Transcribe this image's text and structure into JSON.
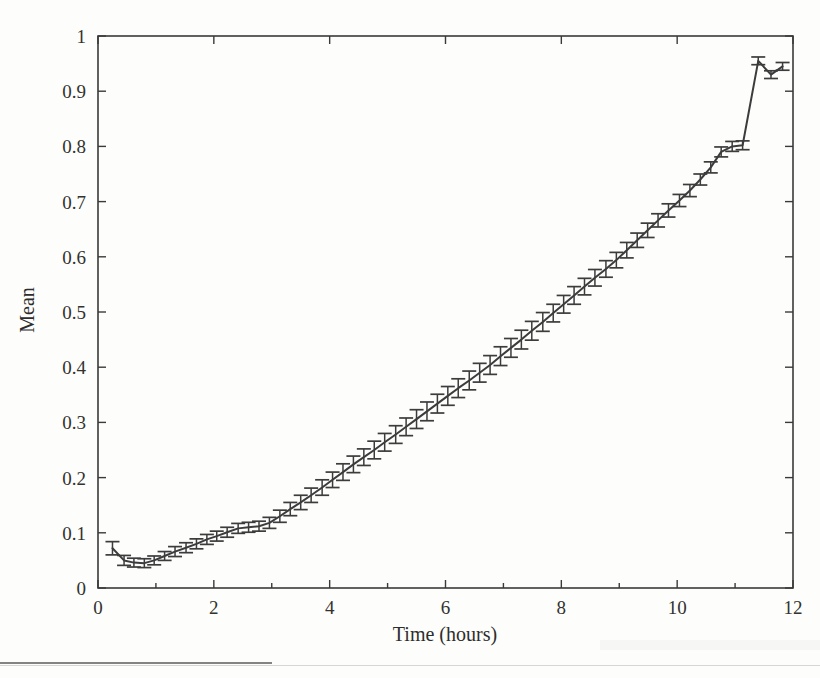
{
  "figure": {
    "background_color": "#fdfdfc",
    "ink_color": "#3c3c3c"
  },
  "chart_data": {
    "type": "line",
    "title": "",
    "subtitle": "",
    "xlabel": "Time (hours)",
    "ylabel": "Mean",
    "xlim": [
      0,
      12
    ],
    "ylim": [
      0,
      1
    ],
    "grid": false,
    "legend": null,
    "xticks": [
      0,
      2,
      4,
      6,
      8,
      10,
      12
    ],
    "xticklabels": [
      "0",
      "2",
      "4",
      "6",
      "8",
      "10",
      "12"
    ],
    "x_minor_ticks": [
      1,
      3,
      5,
      7,
      9,
      11
    ],
    "yticks": [
      0,
      0.1,
      0.2,
      0.3,
      0.4,
      0.5,
      0.6,
      0.7,
      0.8,
      0.9,
      1
    ],
    "yticklabels": [
      "0",
      "0.1",
      "0.2",
      "0.3",
      "0.4",
      "0.5",
      "0.6",
      "0.7",
      "0.8",
      "0.9",
      "1"
    ],
    "has_error_bars": true,
    "error_bar_style": "capped-vertical",
    "series": [
      {
        "name": "Mean",
        "x": [
          0.25,
          0.45,
          0.62,
          0.8,
          0.97,
          1.15,
          1.33,
          1.52,
          1.7,
          1.88,
          2.05,
          2.23,
          2.42,
          2.6,
          2.78,
          2.96,
          3.14,
          3.32,
          3.5,
          3.68,
          3.87,
          4.05,
          4.23,
          4.41,
          4.59,
          4.77,
          4.95,
          5.14,
          5.32,
          5.5,
          5.68,
          5.86,
          6.04,
          6.22,
          6.41,
          6.59,
          6.77,
          6.95,
          7.13,
          7.31,
          7.49,
          7.68,
          7.86,
          8.04,
          8.22,
          8.4,
          8.58,
          8.77,
          8.95,
          9.13,
          9.31,
          9.49,
          9.67,
          9.85,
          10.04,
          10.22,
          10.4,
          10.58,
          10.76,
          10.95,
          11.13,
          11.4,
          11.62,
          11.82
        ],
        "y": [
          0.072,
          0.05,
          0.046,
          0.045,
          0.05,
          0.058,
          0.066,
          0.073,
          0.08,
          0.088,
          0.094,
          0.101,
          0.108,
          0.11,
          0.112,
          0.118,
          0.13,
          0.143,
          0.155,
          0.168,
          0.182,
          0.196,
          0.21,
          0.224,
          0.237,
          0.25,
          0.264,
          0.278,
          0.292,
          0.306,
          0.32,
          0.334,
          0.348,
          0.362,
          0.376,
          0.39,
          0.404,
          0.42,
          0.435,
          0.45,
          0.466,
          0.482,
          0.498,
          0.514,
          0.53,
          0.546,
          0.562,
          0.578,
          0.594,
          0.612,
          0.63,
          0.648,
          0.666,
          0.684,
          0.702,
          0.72,
          0.74,
          0.762,
          0.79,
          0.8,
          0.802,
          0.955,
          0.93,
          0.945
        ],
        "yerr": [
          0.012,
          0.009,
          0.008,
          0.008,
          0.008,
          0.008,
          0.009,
          0.009,
          0.009,
          0.009,
          0.009,
          0.009,
          0.009,
          0.009,
          0.009,
          0.01,
          0.011,
          0.012,
          0.013,
          0.013,
          0.014,
          0.014,
          0.015,
          0.015,
          0.015,
          0.016,
          0.016,
          0.016,
          0.016,
          0.017,
          0.017,
          0.017,
          0.017,
          0.017,
          0.017,
          0.017,
          0.017,
          0.017,
          0.017,
          0.017,
          0.017,
          0.017,
          0.016,
          0.016,
          0.016,
          0.015,
          0.015,
          0.015,
          0.014,
          0.014,
          0.013,
          0.013,
          0.012,
          0.012,
          0.011,
          0.011,
          0.01,
          0.01,
          0.009,
          0.009,
          0.008,
          0.007,
          0.007,
          0.007
        ]
      }
    ],
    "annotations": [
      {
        "text": "initial dip minimum near t = 0.8 h, Mean ≈ 0.045"
      },
      {
        "text": "near-linear rise from t ≈ 3 h to t ≈ 11 h"
      },
      {
        "text": "peak Mean ≈ 0.955 at t ≈ 11.4 h, then dip to ≈ 0.93 and recovery to ≈ 0.945"
      }
    ]
  }
}
